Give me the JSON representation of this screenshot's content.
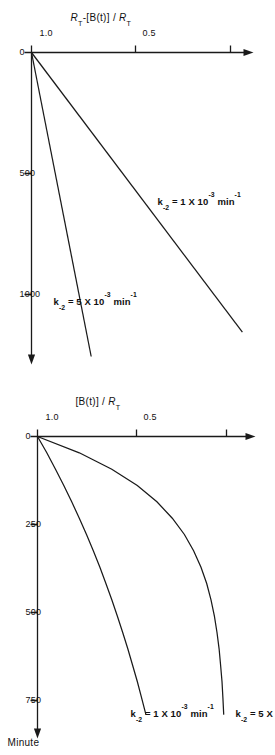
{
  "figure": {
    "orientation": "rotated-90-clockwise",
    "ink_color": "#1a1a1a",
    "background": "#ffffff"
  },
  "panels": [
    {
      "id": "decay-panel",
      "position_in_page": "bottom",
      "y_axis": {
        "label_html": "[B(t)] / <i>R</i><sub>T</sub>",
        "ticks": [
          "0.5",
          "1.0"
        ],
        "tick_values": [
          0.5,
          1.0
        ],
        "range": [
          0,
          1.15
        ]
      },
      "x_axis": {
        "label": "Minute",
        "ticks": [
          "0",
          "250",
          "500",
          "750"
        ],
        "tick_values": [
          0,
          250,
          500,
          750
        ],
        "range": [
          0,
          900
        ]
      },
      "curve_labels": [
        {
          "html": "k<sub>-2</sub> = 5 X 10<sup>-3</sup> min"
        },
        {
          "html": "k<sub>-2</sub> = 1 X 10<sup>-3</sup> min<sup>-1</sup>"
        }
      ]
    },
    {
      "id": "accumulation-panel",
      "position_in_page": "top",
      "y_axis": {
        "label_html": "<i>R</i><sub>T</sub>-[B(t)] / <i>R</i><sub>T</sub>",
        "ticks": [
          "0.5",
          "1.0"
        ],
        "tick_values": [
          0.5,
          1.0
        ],
        "range": [
          0,
          1.15
        ]
      },
      "x_axis": {
        "label": "",
        "ticks": [
          "0",
          "500",
          "1000"
        ],
        "tick_values": [
          0,
          500,
          1000
        ],
        "range": [
          0,
          1250
        ]
      },
      "curve_labels": [
        {
          "html": "k<sub>-2</sub> = 1 X 10<sup>-3</sup> min<sup>-1</sup>"
        },
        {
          "html": "k<sub>-2</sub> = 5 X 10<sup>-3</sup> min<sup>-1</sup>"
        }
      ]
    }
  ],
  "chart_data": [
    {
      "type": "line",
      "id": "decay-panel",
      "title": "",
      "xlabel": "Minute",
      "ylabel": "[B(t)] / R_T",
      "xlim": [
        0,
        900
      ],
      "ylim": [
        0,
        1.15
      ],
      "xticks": [
        0,
        250,
        500,
        750
      ],
      "yticks": [
        0.5,
        1.0
      ],
      "grid": false,
      "legend": "inline-curve-labels",
      "series": [
        {
          "name": "k_-2 = 5X10^-3 min",
          "x": [
            0,
            50,
            100,
            150,
            200,
            250,
            300,
            350,
            400,
            450,
            500,
            550,
            600,
            650,
            700,
            750,
            800,
            850
          ],
          "y": [
            0.0,
            0.221,
            0.393,
            0.528,
            0.632,
            0.713,
            0.777,
            0.826,
            0.865,
            0.895,
            0.918,
            0.936,
            0.95,
            0.961,
            0.969,
            0.976,
            0.981,
            0.985
          ]
        },
        {
          "name": "k_-2 = 1X10^-3 min^-1",
          "x": [
            0,
            50,
            100,
            150,
            200,
            250,
            300,
            350,
            400,
            450,
            500,
            550,
            600,
            650,
            700,
            750,
            800,
            850
          ],
          "y": [
            0.0,
            0.049,
            0.095,
            0.139,
            0.181,
            0.221,
            0.259,
            0.295,
            0.33,
            0.362,
            0.393,
            0.423,
            0.451,
            0.478,
            0.503,
            0.528,
            0.551,
            0.573
          ]
        }
      ]
    },
    {
      "type": "line",
      "id": "accumulation-panel",
      "title": "",
      "xlabel": "",
      "ylabel": "R_T-[B(t)] / R_T",
      "xlim": [
        0,
        1250
      ],
      "ylim": [
        0,
        1.15
      ],
      "xticks": [
        0,
        500,
        1000
      ],
      "yticks": [
        0.5,
        1.0
      ],
      "grid": false,
      "legend": "inline-curve-labels",
      "series": [
        {
          "name": "k_-2 = 1X10^-3 min^-1",
          "x": [
            0,
            1150
          ],
          "y": [
            0.0,
            1.06
          ]
        },
        {
          "name": "k_-2 = 5X10^-3 min^-1",
          "x": [
            0,
            1250
          ],
          "y": [
            0.0,
            0.3
          ]
        }
      ]
    }
  ]
}
